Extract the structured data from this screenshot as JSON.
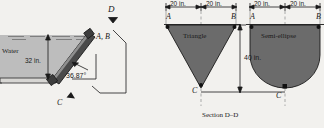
{
  "figure": {
    "background_color": "#f2f1ee",
    "shape_fill": "#6b6b6b",
    "water_fill": "#bdbdbd",
    "line_color": "#1a1a1a"
  },
  "left_view": {
    "water_label": "Water",
    "depth_dimension": "32 in.",
    "angle_label": "36.87°",
    "section_marker_top": "D",
    "plate_top_label": "A, B",
    "plate_bottom_label": "C"
  },
  "right_view": {
    "caption": "Section D–D",
    "height_dimension": "40 in.",
    "shapes": [
      {
        "name": "Triangle",
        "label": "Triangle",
        "left_width": "20 in.",
        "right_width": "20 in.",
        "corner_left_label": "A",
        "corner_right_label": "B",
        "apex_label": "C"
      },
      {
        "name": "Semi-ellipse",
        "label": "Semi-ellipse",
        "left_width": "20 in.",
        "right_width": "20 in.",
        "corner_left_label": "A",
        "corner_right_label": "B",
        "apex_label": "C"
      }
    ]
  }
}
